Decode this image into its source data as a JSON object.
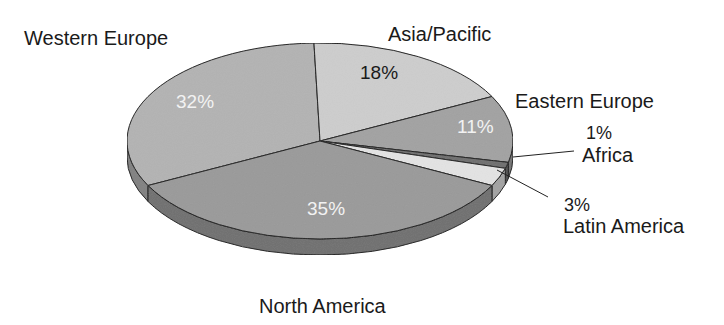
{
  "chart_data": {
    "type": "pie",
    "style": "3d",
    "title": "",
    "categories": [
      "North America",
      "Western Europe",
      "Asia/Pacific",
      "Eastern Europe",
      "Africa",
      "Latin America"
    ],
    "values": [
      35,
      32,
      18,
      11,
      1,
      3
    ],
    "labels": {
      "north_america": {
        "name": "North America",
        "pct": "35%"
      },
      "western_europe": {
        "name": "Western Europe",
        "pct": "32%"
      },
      "asia_pacific": {
        "name": "Asia/Pacific",
        "pct": "18%"
      },
      "eastern_europe": {
        "name": "Eastern Europe",
        "pct": "11%"
      },
      "africa": {
        "name": "Africa",
        "pct": "1%"
      },
      "latin_america": {
        "name": "Latin America",
        "pct": "3%"
      }
    },
    "colors": {
      "north_america": "#9a9a9a",
      "western_europe": "#b3b3b3",
      "asia_pacific": "#cdcdcd",
      "eastern_europe": "#a2a2a2",
      "africa": "#6e6e6e",
      "latin_america": "#e3e3e3"
    },
    "legend": "none"
  }
}
